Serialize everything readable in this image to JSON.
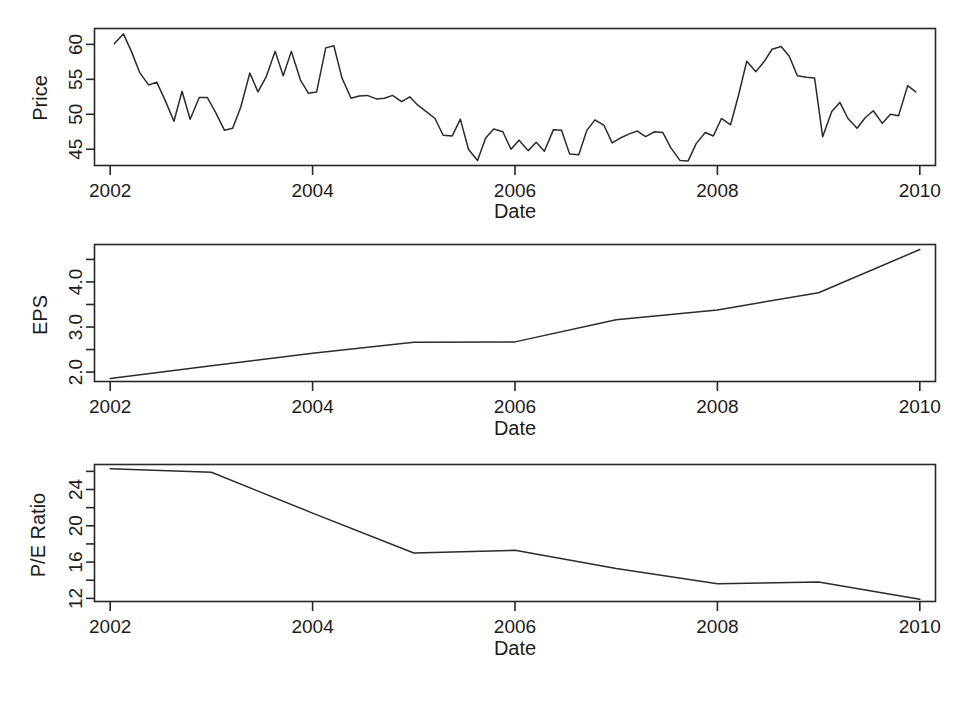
{
  "figure": {
    "background": "#ffffff",
    "line_color": "#2b2b2b",
    "axis_color": "#272727",
    "panel_count": 3
  },
  "chart_data": [
    {
      "type": "line",
      "title": "",
      "panel": "price",
      "xlabel": "Date",
      "ylabel": "Price",
      "xlim": [
        2001.85,
        2010.15
      ],
      "ylim": [
        42.6,
        62.2
      ],
      "grid": false,
      "legend": null,
      "xticks": [
        2002,
        2004,
        2006,
        2008,
        2010
      ],
      "xtick_labels": [
        "2002",
        "2004",
        "2006",
        "2008",
        "2010"
      ],
      "yticks": [
        45,
        50,
        55,
        60
      ],
      "ytick_labels": [
        "45",
        "50",
        "55",
        "60"
      ],
      "x": [
        2002.04,
        2002.13,
        2002.21,
        2002.29,
        2002.38,
        2002.46,
        2002.54,
        2002.63,
        2002.71,
        2002.79,
        2002.88,
        2002.96,
        2003.04,
        2003.13,
        2003.21,
        2003.29,
        2003.38,
        2003.46,
        2003.54,
        2003.63,
        2003.71,
        2003.79,
        2003.88,
        2003.96,
        2004.04,
        2004.13,
        2004.21,
        2004.29,
        2004.38,
        2004.46,
        2004.54,
        2004.63,
        2004.71,
        2004.79,
        2004.88,
        2004.96,
        2005.04,
        2005.13,
        2005.21,
        2005.29,
        2005.38,
        2005.46,
        2005.54,
        2005.63,
        2005.71,
        2005.79,
        2005.88,
        2005.96,
        2006.04,
        2006.13,
        2006.21,
        2006.29,
        2006.38,
        2006.46,
        2006.54,
        2006.63,
        2006.71,
        2006.79,
        2006.88,
        2006.96,
        2007.04,
        2007.13,
        2007.21,
        2007.29,
        2007.38,
        2007.46,
        2007.54,
        2007.63,
        2007.71,
        2007.79,
        2007.88,
        2007.96,
        2008.04,
        2008.13,
        2008.21,
        2008.29,
        2008.38,
        2008.46,
        2008.54,
        2008.63,
        2008.71,
        2008.79,
        2008.88,
        2008.96,
        2009.04,
        2009.13,
        2009.21,
        2009.29,
        2009.38,
        2009.46,
        2009.54,
        2009.63,
        2009.71,
        2009.79,
        2009.88,
        2009.96
      ],
      "y": [
        60.1,
        61.5,
        59.0,
        56.0,
        54.2,
        54.6,
        52.1,
        49.0,
        53.3,
        49.3,
        52.4,
        52.4,
        50.3,
        47.7,
        48.0,
        51.0,
        55.9,
        53.2,
        55.3,
        59.0,
        55.5,
        59.0,
        54.9,
        53.0,
        53.2,
        59.5,
        59.8,
        55.2,
        52.3,
        52.6,
        52.7,
        52.2,
        52.3,
        52.7,
        51.8,
        52.5,
        51.3,
        50.3,
        49.4,
        47.0,
        46.9,
        49.3,
        45.0,
        43.4,
        46.6,
        47.9,
        47.5,
        45.0,
        46.3,
        44.8,
        46.0,
        44.7,
        47.8,
        47.7,
        44.3,
        44.2,
        47.7,
        49.2,
        48.4,
        45.9,
        46.6,
        47.2,
        47.6,
        46.8,
        47.5,
        47.4,
        45.2,
        43.4,
        43.3,
        45.8,
        47.4,
        46.9,
        49.4,
        48.5,
        52.8,
        57.6,
        56.1,
        57.5,
        59.3,
        59.7,
        58.3,
        55.5,
        55.3,
        55.2,
        46.8,
        50.4,
        51.7,
        49.4,
        48.0,
        49.5,
        50.5,
        48.7,
        50.0,
        49.8,
        54.1,
        53.2
      ]
    },
    {
      "type": "line",
      "title": "",
      "panel": "eps",
      "xlabel": "Date",
      "ylabel": "EPS",
      "xlim": [
        2001.85,
        2010.15
      ],
      "ylim": [
        1.78,
        4.82
      ],
      "grid": false,
      "legend": null,
      "xticks": [
        2002,
        2004,
        2006,
        2008,
        2010
      ],
      "xtick_labels": [
        "2002",
        "2004",
        "2006",
        "2008",
        "2010"
      ],
      "yticks": [
        2.0,
        3.0,
        4.0
      ],
      "ytick_labels": [
        "2.0",
        "3.0",
        "4.0"
      ],
      "minor_yticks": [
        2.5,
        3.5,
        4.5
      ],
      "x": [
        2002,
        2003,
        2004,
        2005,
        2006,
        2007,
        2008,
        2009,
        2010
      ],
      "y": [
        1.86,
        2.14,
        2.42,
        2.66,
        2.67,
        3.16,
        3.38,
        3.76,
        4.72
      ]
    },
    {
      "type": "line",
      "title": "",
      "panel": "pe_ratio",
      "xlabel": "Date",
      "ylabel": "P/E Ratio",
      "xlim": [
        2001.85,
        2010.15
      ],
      "ylim": [
        11.6,
        26.7
      ],
      "grid": false,
      "legend": null,
      "xticks": [
        2002,
        2004,
        2006,
        2008,
        2010
      ],
      "xtick_labels": [
        "2002",
        "2004",
        "2006",
        "2008",
        "2010"
      ],
      "yticks": [
        12,
        16,
        20,
        24
      ],
      "ytick_labels": [
        "12",
        "16",
        "20",
        "24"
      ],
      "minor_yticks": [
        14,
        18,
        22,
        26
      ],
      "x": [
        2002,
        2003,
        2004,
        2005,
        2006,
        2007,
        2008,
        2009,
        2010
      ],
      "y": [
        26.3,
        25.9,
        21.4,
        17.0,
        17.3,
        15.3,
        13.6,
        13.8,
        11.9
      ]
    }
  ],
  "panels": {
    "price": {
      "ylabel": "EPS_placeholder",
      "y_axis_title": "Price",
      "x_axis_title": "Date",
      "ytick_labels": [
        "45",
        "50",
        "55",
        "60"
      ],
      "xtick_labels": [
        "2002",
        "2004",
        "2006",
        "2008",
        "2010"
      ]
    },
    "eps": {
      "y_axis_title": "EPS",
      "x_axis_title": "Date",
      "ytick_labels": [
        "2.0",
        "3.0",
        "4.0"
      ],
      "xtick_labels": [
        "2002",
        "2004",
        "2006",
        "2008",
        "2010"
      ]
    },
    "pe_ratio": {
      "y_axis_title": "P/E Ratio",
      "x_axis_title": "Date",
      "ytick_labels": [
        "12",
        "16",
        "20",
        "24"
      ],
      "xtick_labels": [
        "2002",
        "2004",
        "2006",
        "2008",
        "2010"
      ]
    }
  }
}
